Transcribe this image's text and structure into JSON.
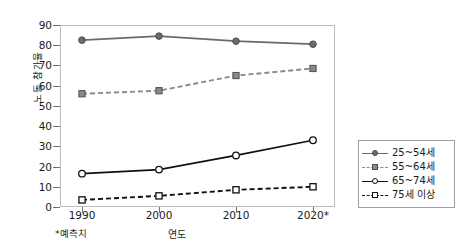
{
  "chart_data": {
    "type": "line",
    "title": "",
    "xlabel": "연도",
    "ylabel": "노동 참가율",
    "footnote": "*예측치",
    "categories": [
      "1990",
      "2000",
      "2010",
      "2020*"
    ],
    "x": [
      1990,
      2000,
      2010,
      2020
    ],
    "ylim": [
      0,
      90
    ],
    "ytick_step": 10,
    "yticks": [
      "90",
      "80",
      "70",
      "60",
      "50",
      "40",
      "30",
      "20",
      "10",
      "0"
    ],
    "grid": false,
    "legend_position": "right",
    "series": [
      {
        "name": "25~54세",
        "values": [
          82.5,
          84.5,
          82.0,
          80.5
        ],
        "color": "#6b6b6b",
        "line_style": "solid",
        "marker": "circle-filled"
      },
      {
        "name": "55~64세",
        "values": [
          56.0,
          57.5,
          65.0,
          68.5
        ],
        "color": "#8a8a8a",
        "line_style": "dashed",
        "marker": "square-filled"
      },
      {
        "name": "65~74세",
        "values": [
          16.5,
          18.5,
          25.5,
          33.0
        ],
        "color": "#111111",
        "line_style": "solid",
        "marker": "circle-open"
      },
      {
        "name": "75세 이상",
        "values": [
          3.5,
          5.5,
          8.5,
          10.0
        ],
        "color": "#111111",
        "line_style": "dashed",
        "marker": "square-open"
      }
    ]
  }
}
